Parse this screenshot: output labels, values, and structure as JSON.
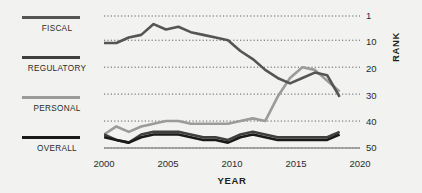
{
  "chart_data": {
    "type": "line",
    "title": "",
    "subtitle": "",
    "xlabel": "YEAR",
    "ylabel": "RANK",
    "xlim": [
      2000,
      2020
    ],
    "ylim": [
      1,
      50
    ],
    "y_inverted": true,
    "grid": "horizontal-dotted",
    "legend_position": "left",
    "x_ticks": [
      "2000",
      "2005",
      "2010",
      "2015",
      "2020"
    ],
    "x_tick_values": [
      2000,
      2005,
      2010,
      2015,
      2020
    ],
    "y_ticks": [
      "1",
      "10",
      "20",
      "30",
      "40",
      "50"
    ],
    "y_tick_values": [
      1,
      10,
      20,
      30,
      40,
      50
    ],
    "x": [
      2000,
      2001,
      2002,
      2003,
      2004,
      2005,
      2006,
      2007,
      2008,
      2009,
      2010,
      2011,
      2012,
      2013,
      2014,
      2015,
      2016,
      2017,
      2018,
      2019
    ],
    "series": [
      {
        "name": "FISCAL",
        "color": "#555555",
        "values": [
          11,
          11,
          9,
          8,
          4,
          6,
          5,
          7,
          8,
          9,
          10,
          14,
          17,
          21,
          24,
          26,
          24,
          22,
          23,
          31
        ]
      },
      {
        "name": "REGULATORY",
        "color": "#3f3f3f",
        "values": [
          45,
          47,
          48,
          45,
          44,
          44,
          44,
          45,
          46,
          46,
          47,
          45,
          44,
          45,
          46,
          46,
          46,
          46,
          46,
          44
        ]
      },
      {
        "name": "PERSONAL",
        "color": "#9b9b9b",
        "values": [
          45,
          42,
          44,
          42,
          41,
          40,
          40,
          41,
          41,
          41,
          41,
          40,
          39,
          40,
          31,
          24,
          20,
          21,
          25,
          29
        ]
      },
      {
        "name": "OVERALL",
        "color": "#1a1a1a",
        "values": [
          46,
          47,
          48,
          46,
          45,
          45,
          45,
          46,
          47,
          47,
          48,
          46,
          45,
          46,
          47,
          47,
          47,
          47,
          47,
          45
        ]
      }
    ]
  },
  "legend": {
    "items": [
      {
        "label": "FISCAL",
        "color": "#555555"
      },
      {
        "label": "REGULATORY",
        "color": "#3f3f3f"
      },
      {
        "label": "PERSONAL",
        "color": "#9b9b9b"
      },
      {
        "label": "OVERALL",
        "color": "#1a1a1a"
      }
    ]
  },
  "axes": {
    "x_label": "YEAR",
    "y_label": "RANK"
  },
  "colors": {
    "background": "#f2f2f0",
    "axis": "#8a8a8a",
    "grid": "#5e5e5e",
    "text": "#2b2b2b"
  }
}
